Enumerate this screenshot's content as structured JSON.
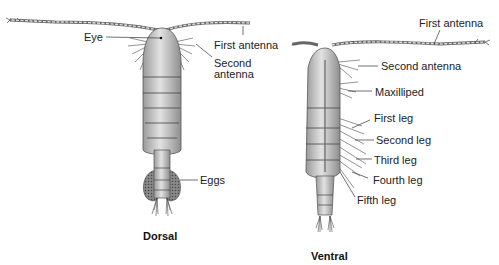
{
  "figure": {
    "dorsal": {
      "caption": "Dorsal",
      "labels": {
        "eye": "Eye",
        "first_antenna": "First antenna",
        "second_antenna_line1": "Second",
        "second_antenna_line2": "antenna",
        "eggs": "Eggs"
      }
    },
    "ventral": {
      "caption": "Ventral",
      "labels": {
        "first_antenna": "First antenna",
        "second_antenna": "Second antenna",
        "maxilliped": "Maxilliped",
        "first_leg": "First leg",
        "second_leg": "Second leg",
        "third_leg": "Third leg",
        "fourth_leg": "Fourth leg",
        "fifth_leg": "Fifth leg"
      }
    },
    "colors": {
      "body": "#c8c8c8",
      "outline": "#555555",
      "eggs": "#7a7a7a",
      "leader": "#333333"
    }
  }
}
